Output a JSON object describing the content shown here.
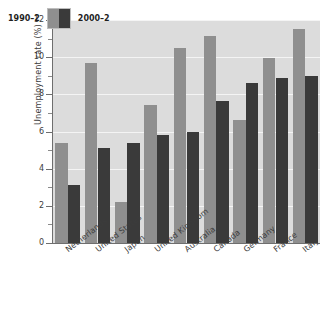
{
  "chart_data": {
    "type": "bar",
    "title": "",
    "xlabel": "",
    "ylabel": "Unemployment rate (%)",
    "ylim": [
      0,
      12
    ],
    "ytick_labels": [
      "0",
      "2",
      "4",
      "6",
      "8",
      "10",
      "12"
    ],
    "ytick_values": [
      0,
      2,
      4,
      6,
      8,
      10,
      12
    ],
    "yminor_values": [
      1,
      3,
      5,
      7,
      9,
      11
    ],
    "grid": true,
    "grid_axis": "y",
    "legend_position": "upper-left-inside",
    "categories": [
      "Netherlands",
      "United States",
      "Japan",
      "United Kingdom",
      "Australia",
      "Canada",
      "Germany",
      "France",
      "Italy"
    ],
    "series": [
      {
        "name": "1990–2",
        "color": "#8f8f8f",
        "values": [
          5.4,
          9.7,
          2.2,
          7.45,
          10.5,
          11.15,
          6.6,
          9.95,
          11.5
        ]
      },
      {
        "name": "2000–2",
        "color": "#3a3a3a",
        "values": [
          3.1,
          5.1,
          5.4,
          5.8,
          5.95,
          7.65,
          8.6,
          8.9,
          9.0
        ]
      }
    ]
  },
  "style": {
    "plot_background": "#dcdcdc",
    "figure_background": "#ffffff",
    "gridline_color": "#f4f4f4",
    "axis_color": "#6e6e6e",
    "text_color": "#3c3c3c"
  }
}
